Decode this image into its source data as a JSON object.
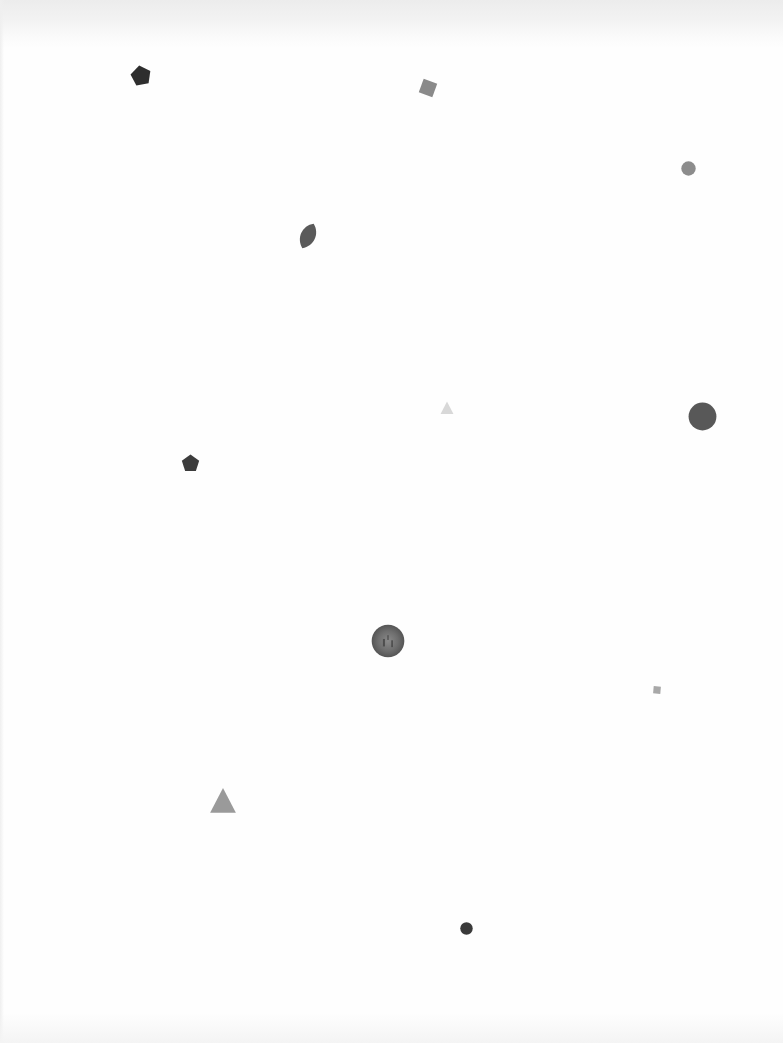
{
  "page": {
    "background": "#fefefe"
  },
  "shapes": [
    {
      "name": "pentagon",
      "x": 141,
      "y": 76,
      "size": 22,
      "color": "#2e2e2e",
      "rotate": -10
    },
    {
      "name": "square",
      "x": 428,
      "y": 88,
      "size": 20,
      "color": "#8a8a8a",
      "rotate": 20
    },
    {
      "name": "circle",
      "x": 688,
      "y": 168,
      "size": 15,
      "color": "#8c8c8c"
    },
    {
      "name": "leaf",
      "x": 308,
      "y": 236,
      "size": 28,
      "color": "#5a5a5a",
      "rotate": 25
    },
    {
      "name": "triangle",
      "x": 447,
      "y": 408,
      "size": 14,
      "color": "#d8d8d8"
    },
    {
      "name": "circle",
      "x": 702,
      "y": 416,
      "size": 29,
      "color": "#585858"
    },
    {
      "name": "pentagon",
      "x": 190,
      "y": 463,
      "size": 19,
      "color": "#3c3c3c",
      "rotate": 0
    },
    {
      "name": "textured-circle",
      "x": 388,
      "y": 641,
      "size": 34,
      "color": "#6e6e6e"
    },
    {
      "name": "square",
      "x": 657,
      "y": 690,
      "size": 10,
      "color": "#a8a8a8",
      "rotate": 5
    },
    {
      "name": "triangle",
      "x": 223,
      "y": 801,
      "size": 28,
      "color": "#9a9a9a"
    },
    {
      "name": "circle",
      "x": 466,
      "y": 928,
      "size": 13,
      "color": "#3a3a3a"
    }
  ]
}
